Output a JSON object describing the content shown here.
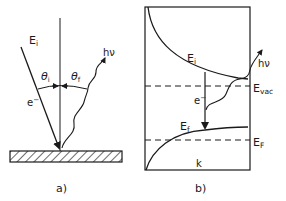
{
  "panel_a": {
    "caption": "a)",
    "incident_energy": "E",
    "incident_energy_sub": "i",
    "electron": "e",
    "electron_sup": "−",
    "theta_i": "θ",
    "theta_i_sub": "i",
    "theta_f": "θ",
    "theta_f_sub": "f",
    "photon": "hν"
  },
  "panel_b": {
    "caption": "b)",
    "initial_state": "E",
    "initial_state_sub": "i",
    "final_state": "E",
    "final_state_sub": "f",
    "electron": "e",
    "electron_sup": "−",
    "photon": "hν",
    "vacuum_level": "E",
    "vacuum_level_sub": "vac",
    "fermi_level": "E",
    "fermi_level_sub": "F",
    "x_axis": "k"
  },
  "colors": {
    "ink": "#1a1a1a",
    "background": "#ffffff"
  }
}
